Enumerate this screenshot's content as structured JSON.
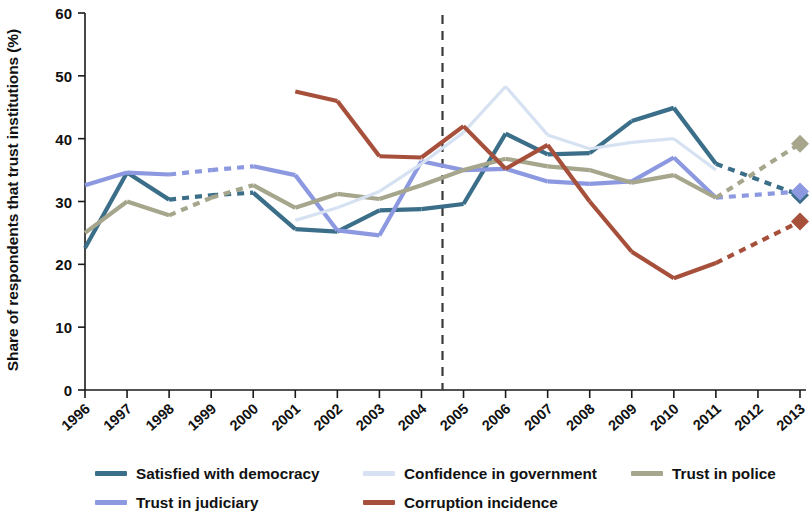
{
  "chart_data": {
    "type": "line",
    "title": "",
    "subtitle": "",
    "xlabel": "",
    "ylabel": "Share of respondents that trust institutions (%)",
    "ylim": [
      0,
      60
    ],
    "yticks": [
      0,
      10,
      20,
      30,
      40,
      50,
      60
    ],
    "grid": false,
    "legend_position": "bottom",
    "categories": [
      "1996",
      "1997",
      "1998",
      "1999",
      "2000",
      "2001",
      "2002",
      "2003",
      "2004",
      "2005",
      "2006",
      "2007",
      "2008",
      "2009",
      "2010",
      "2011",
      "2012",
      "2013"
    ],
    "x": [
      1996,
      1997,
      1998,
      1999,
      2000,
      2001,
      2002,
      2003,
      2004,
      2005,
      2006,
      2007,
      2008,
      2009,
      2010,
      2011,
      2012,
      2013
    ],
    "annotations": [
      {
        "name": "reference-line",
        "type": "vline",
        "x": 2004.5,
        "style": "dashed",
        "color": "#3a3a3a"
      }
    ],
    "series": [
      {
        "name": "Satisfied with democracy",
        "color": "#3b6e88",
        "values": [
          22.6,
          34.6,
          30.3,
          31.0,
          31.4,
          25.6,
          25.2,
          28.6,
          28.8,
          29.6,
          40.8,
          37.5,
          37.7,
          42.8,
          44.9,
          36.0,
          null,
          31.0
        ],
        "dashed_segments": [
          [
            1998,
            2000
          ],
          [
            2011,
            2013
          ]
        ],
        "marker_at": 2013,
        "marker_value": 31.0,
        "marker_shape": "diamond"
      },
      {
        "name": "Trust in judiciary",
        "color": "#8c99e0",
        "values": [
          32.6,
          34.6,
          34.3,
          35.0,
          35.6,
          34.2,
          25.4,
          24.6,
          36.4,
          35.0,
          35.2,
          33.2,
          32.8,
          33.2,
          37.0,
          30.6,
          null,
          31.6
        ],
        "dashed_segments": [
          [
            1998,
            2000
          ],
          [
            2011,
            2013
          ]
        ],
        "marker_at": 2013,
        "marker_value": 31.6,
        "marker_shape": "diamond"
      },
      {
        "name": "Trust in police",
        "color": "#a6a68d",
        "values": [
          25.0,
          30.0,
          27.8,
          30.6,
          32.6,
          29.0,
          31.2,
          30.4,
          32.6,
          35.0,
          36.8,
          35.6,
          35.0,
          33.0,
          34.2,
          30.6,
          null,
          39.2
        ],
        "dashed_segments": [
          [
            1998,
            2000
          ],
          [
            2011,
            2013
          ]
        ],
        "marker_at": 2013,
        "marker_value": 39.2,
        "marker_shape": "diamond"
      },
      {
        "name": "Confidence in government",
        "color": "#d6e2f2",
        "values": [
          null,
          null,
          null,
          null,
          null,
          27.0,
          29.0,
          31.6,
          36.0,
          41.0,
          48.3,
          40.6,
          38.4,
          39.4,
          40.0,
          35.0,
          null,
          null
        ],
        "dashed_segments": [],
        "marker_at": null,
        "marker_value": null,
        "marker_shape": "none"
      },
      {
        "name": "Corruption incidence",
        "color": "#a6503c",
        "values": [
          null,
          null,
          null,
          null,
          null,
          47.5,
          46.0,
          37.2,
          37.0,
          42.0,
          35.2,
          39.0,
          30.0,
          22.0,
          17.8,
          20.2,
          null,
          26.8
        ],
        "dashed_segments": [
          [
            2011,
            2013
          ]
        ],
        "marker_at": 2013,
        "marker_value": 26.8,
        "marker_shape": "diamond"
      }
    ]
  },
  "axis": {
    "ylabel": "Share of respondents that trust institutions (%)",
    "yticks": [
      "0",
      "10",
      "20",
      "30",
      "40",
      "50",
      "60"
    ],
    "xticks": [
      "1996",
      "1997",
      "1998",
      "1999",
      "2000",
      "2001",
      "2002",
      "2003",
      "2004",
      "2005",
      "2006",
      "2007",
      "2008",
      "2009",
      "2010",
      "2011",
      "2012",
      "2013"
    ]
  },
  "legend": {
    "row1": [
      {
        "label": "Satisfied with democracy",
        "color": "#3b6e88"
      },
      {
        "label": "Confidence in government",
        "color": "#d6e2f2"
      },
      {
        "label": "Trust in police",
        "color": "#a6a68d"
      }
    ],
    "row2": [
      {
        "label": "Trust in judiciary",
        "color": "#8c99e0"
      },
      {
        "label": "Corruption incidence",
        "color": "#a6503c"
      }
    ]
  }
}
